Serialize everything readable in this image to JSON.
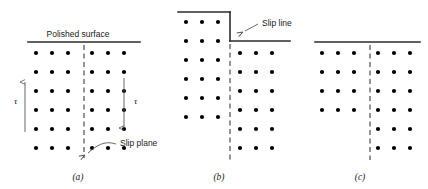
{
  "figure": {
    "background_color": "#ffffff",
    "line_color": "#2b2b2b",
    "atom_color": "#000000",
    "leader_color": "#555555",
    "panels": [
      {
        "id": "a",
        "caption": "(a)",
        "caption_x": 78,
        "caption_y": 180,
        "state": "undeformed",
        "surface_label": "Polished surface",
        "surface_label_x": 78,
        "surface_label_y": 37,
        "surface_segments": [
          {
            "x1": 28,
            "y1": 42,
            "x2": 140,
            "y2": 42
          }
        ],
        "slip_plane_label": "Slip plane",
        "slip_plane_label_x": 120,
        "slip_plane_label_y": 146,
        "slip_plane_line": {
          "x1": 84,
          "y1": 45,
          "x2": 84,
          "y2": 158
        },
        "leader_path": "M 116 144 C 104 140 96 146 88 153",
        "leader_arrow": {
          "x": 85,
          "y": 155,
          "angle": 150
        },
        "stress_left": {
          "label": "τ",
          "label_x": 14,
          "label_y": 104,
          "x": 25,
          "y_tail": 132,
          "y_head": 82,
          "direction": "up"
        },
        "stress_right": {
          "label": "τ",
          "label_x": 134,
          "label_y": 104,
          "x": 124,
          "y_tail": 78,
          "y_head": 128,
          "direction": "down"
        },
        "columns_left_x": [
          36,
          52,
          68
        ],
        "columns_right_x": [
          92,
          108,
          124
        ],
        "rows_left_y": [
          53,
          72,
          91,
          110,
          129,
          148
        ],
        "rows_right_y": [
          53,
          72,
          91,
          110,
          129,
          148
        ]
      },
      {
        "id": "b",
        "caption": "(b)",
        "caption_x": 219,
        "caption_y": 180,
        "state": "slipped-step",
        "slip_line_label": "Slip line",
        "slip_line_label_x": 262,
        "slip_line_label_y": 26,
        "surface_segments": [
          {
            "x1": 178,
            "y1": 12,
            "x2": 230,
            "y2": 12
          },
          {
            "x1": 230,
            "y1": 12,
            "x2": 230,
            "y2": 41
          },
          {
            "x1": 230,
            "y1": 41,
            "x2": 290,
            "y2": 41
          }
        ],
        "leader_path": "M 258 24 L 245 31",
        "leader_arrow": {
          "x": 243,
          "y": 32,
          "angle": 152
        },
        "slip_plane_line": {
          "x1": 230,
          "y1": 44,
          "x2": 230,
          "y2": 160
        },
        "columns_left_x": [
          186,
          202,
          218
        ],
        "columns_right_x": [
          240,
          256,
          272
        ],
        "rows_left_y": [
          22,
          41,
          60,
          79,
          98,
          117
        ],
        "rows_right_y": [
          53,
          72,
          91,
          110,
          129,
          148
        ]
      },
      {
        "id": "c",
        "caption": "(c)",
        "caption_x": 360,
        "caption_y": 180,
        "state": "slipped-flat",
        "surface_segments": [
          {
            "x1": 315,
            "y1": 42,
            "x2": 420,
            "y2": 42
          }
        ],
        "slip_plane_line": {
          "x1": 370,
          "y1": 45,
          "x2": 370,
          "y2": 160
        },
        "columns_left_x": [
          322,
          338,
          354
        ],
        "columns_right_x": [
          378,
          394,
          410
        ],
        "rows_left_y": [
          53,
          72,
          91,
          110
        ],
        "rows_right_y": [
          53,
          72,
          91,
          110,
          129,
          148
        ]
      }
    ]
  }
}
